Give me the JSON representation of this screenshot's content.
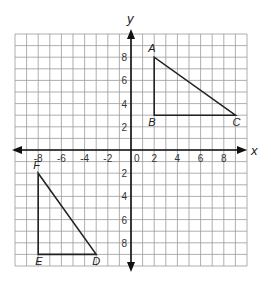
{
  "chart_data": {
    "type": "coordinate-plane",
    "xlabel": "x",
    "ylabel": "y",
    "xlim": [
      -10,
      10
    ],
    "ylim": [
      -10,
      10
    ],
    "grid": true,
    "x_ticks": [
      -8,
      -6,
      -4,
      -2,
      0,
      2,
      4,
      6,
      8
    ],
    "y_ticks": [
      8,
      6,
      4,
      2,
      -2,
      -4,
      -6,
      -8
    ],
    "x_tick_labels": [
      "-8",
      "-6",
      "-4",
      "-2",
      "0",
      "2",
      "4",
      "6",
      "8"
    ],
    "y_tick_labels": [
      "8",
      "6",
      "4",
      "2",
      "2",
      "4",
      "6",
      "8"
    ],
    "shapes": [
      {
        "name": "triangle ABC",
        "vertices": [
          {
            "label": "A",
            "x": 2,
            "y": 8
          },
          {
            "label": "B",
            "x": 2,
            "y": 3
          },
          {
            "label": "C",
            "x": 9,
            "y": 3
          }
        ]
      },
      {
        "name": "triangle DEF",
        "vertices": [
          {
            "label": "D",
            "x": -3,
            "y": -9
          },
          {
            "label": "E",
            "x": -8,
            "y": -9
          },
          {
            "label": "F",
            "x": -8,
            "y": -2
          }
        ]
      }
    ]
  },
  "colors": {
    "grid": "#9a9a9a",
    "axis": "#111111",
    "shape": "#222222"
  }
}
